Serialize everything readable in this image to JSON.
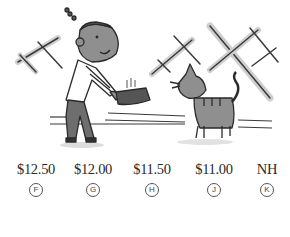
{
  "question": {
    "illustration": {
      "description": "Boy holding out a bowl of food to a striped cat; window frames in background",
      "elements": [
        "boy",
        "food-bowl",
        "cat",
        "window-crosses",
        "floor-lines"
      ]
    },
    "choices": [
      {
        "letter": "F",
        "value": "$12.50"
      },
      {
        "letter": "G",
        "value": "$12.00"
      },
      {
        "letter": "H",
        "value": "$11.50"
      },
      {
        "letter": "J",
        "value": "$11.00"
      },
      {
        "letter": "K",
        "value": "NH"
      }
    ]
  },
  "colors": {
    "ink": "#2a2a2a",
    "skin": "#8a8a8a",
    "pants": "#6e6e6e",
    "shadow": "#c4c4c4"
  }
}
